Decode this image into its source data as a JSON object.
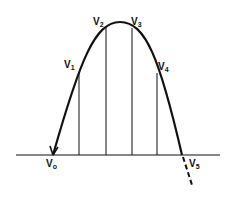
{
  "diagram": {
    "type": "parabolic trajectory with vertical ordinates",
    "colors": {
      "stroke": "#111111",
      "background": "#ffffff"
    },
    "labels": {
      "v0": {
        "base": "V",
        "sub": "o"
      },
      "v1": {
        "base": "V",
        "sub": "1"
      },
      "v2": {
        "base": "V",
        "sub": "2"
      },
      "v3": {
        "base": "V",
        "sub": "3"
      },
      "v4": {
        "base": "V",
        "sub": "4"
      },
      "v5": {
        "base": "V",
        "sub": "5"
      }
    },
    "elements": [
      "horizontal baseline",
      "parabolic arc from V0 to V5 with arrowhead at V0",
      "four vertical ordinates at V1, V2, V3, V4",
      "dashed continuation of curve below baseline past V5"
    ]
  }
}
